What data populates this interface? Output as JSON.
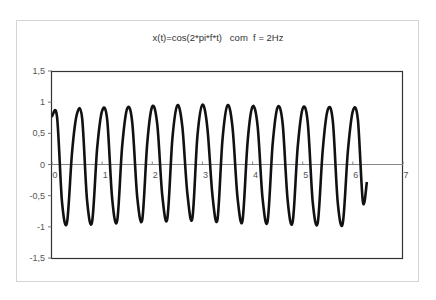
{
  "chart_data": {
    "type": "line",
    "title": "x(t)=cos(2*pi*f*t)   com  f = 2Hz",
    "xlabel": "",
    "ylabel": "",
    "xlim": [
      0,
      7
    ],
    "ylim": [
      -1.5,
      1.5
    ],
    "x_ticks": [
      "0",
      "1",
      "2",
      "3",
      "4",
      "5",
      "6",
      "7"
    ],
    "y_ticks": [
      "1,5",
      "1",
      "0,5",
      "0",
      "-0,5",
      "-1",
      "-1,5"
    ],
    "grid": false,
    "legend": null,
    "line_color": "#111111",
    "series": [
      {
        "name": "x(t)",
        "x": [
          0,
          0.1,
          0.2,
          0.3,
          0.4,
          0.5,
          0.6,
          0.7,
          0.8,
          0.9,
          1.0,
          1.1,
          1.2,
          1.3,
          1.4,
          1.5,
          1.6,
          1.7,
          1.8,
          1.9,
          2.0,
          2.1,
          2.2,
          2.3,
          2.4,
          2.5,
          2.6,
          2.7,
          2.8,
          2.9,
          3.0,
          3.1,
          3.2,
          3.3,
          3.4,
          3.5,
          3.6,
          3.7,
          3.8,
          3.9,
          4.0,
          4.1,
          4.2,
          4.3,
          4.4,
          4.5,
          4.6,
          4.7,
          4.8,
          4.9,
          5.0,
          5.1,
          5.2,
          5.3,
          5.4,
          5.5,
          5.6,
          5.7,
          5.8,
          5.9,
          6.0,
          6.1,
          6.2,
          6.28
        ],
        "y": [
          0.77,
          0.77,
          -0.6,
          -0.93,
          0.2,
          0.82,
          0.75,
          -0.58,
          -0.92,
          0.25,
          0.86,
          0.72,
          -0.55,
          -0.9,
          0.3,
          0.9,
          0.68,
          -0.52,
          -0.88,
          0.35,
          0.93,
          0.64,
          -0.5,
          -0.87,
          0.4,
          0.95,
          0.6,
          -0.47,
          -0.86,
          0.45,
          0.96,
          0.58,
          -0.5,
          -0.88,
          0.4,
          0.95,
          0.6,
          -0.53,
          -0.9,
          0.36,
          0.93,
          0.62,
          -0.55,
          -0.91,
          0.32,
          0.92,
          0.65,
          -0.58,
          -0.92,
          0.28,
          0.9,
          0.68,
          -0.6,
          -0.93,
          0.24,
          0.88,
          0.7,
          -0.62,
          -0.94,
          0.2,
          0.86,
          0.72,
          -0.6,
          -0.28
        ]
      }
    ]
  }
}
